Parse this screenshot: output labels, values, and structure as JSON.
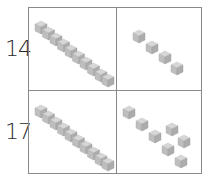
{
  "rows": [
    {
      "number": "14",
      "tens": 1,
      "ones": 4
    },
    {
      "number": "17",
      "tens": 1,
      "ones": 7
    }
  ],
  "colors": {
    "cube_top": "#d4d4d4",
    "cube_left": "#bdbdbd",
    "cube_right": "#a9a9a9",
    "grid_line": "#8a8a8a",
    "text": "#2a2a2a"
  }
}
